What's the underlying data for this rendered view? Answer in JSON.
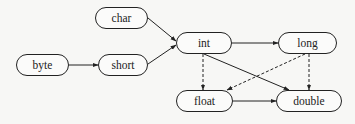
{
  "diagram": {
    "title": "",
    "nodes": {
      "char": {
        "label": "char",
        "x": 95,
        "y": 7,
        "w": 53,
        "h": 22
      },
      "byte": {
        "label": "byte",
        "x": 16,
        "y": 54,
        "w": 53,
        "h": 22
      },
      "short": {
        "label": "short",
        "x": 98,
        "y": 54,
        "w": 50,
        "h": 22
      },
      "int": {
        "label": "int",
        "x": 176,
        "y": 32,
        "w": 56,
        "h": 22
      },
      "long": {
        "label": "long",
        "x": 278,
        "y": 32,
        "w": 59,
        "h": 22
      },
      "float": {
        "label": "float",
        "x": 176,
        "y": 90,
        "w": 57,
        "h": 22
      },
      "double": {
        "label": "double",
        "x": 276,
        "y": 90,
        "w": 66,
        "h": 22
      }
    },
    "edges": [
      {
        "from": "byte",
        "to": "short",
        "style": "solid"
      },
      {
        "from": "char",
        "to": "int",
        "style": "solid"
      },
      {
        "from": "short",
        "to": "int",
        "style": "solid"
      },
      {
        "from": "int",
        "to": "long",
        "style": "solid"
      },
      {
        "from": "int",
        "to": "double",
        "style": "solid"
      },
      {
        "from": "float",
        "to": "double",
        "style": "solid"
      },
      {
        "from": "int",
        "to": "float",
        "style": "dashed"
      },
      {
        "from": "long",
        "to": "float",
        "style": "dashed"
      },
      {
        "from": "long",
        "to": "double",
        "style": "dashed"
      }
    ],
    "colors": {
      "stroke": "#222222",
      "background": "#f7f7f5",
      "node_fill": "#fbfbfa"
    }
  }
}
